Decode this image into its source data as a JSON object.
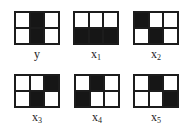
{
  "diagram": {
    "panels": [
      {
        "id": "y",
        "label_base": "y",
        "label_sub": "",
        "cells": [
          0,
          1,
          0,
          0,
          1,
          0
        ],
        "pos": [
          14,
          11
        ]
      },
      {
        "id": "x1",
        "label_base": "x",
        "label_sub": "1",
        "cells": [
          0,
          0,
          0,
          1,
          1,
          1
        ],
        "pos": [
          73,
          11
        ]
      },
      {
        "id": "x2",
        "label_base": "x",
        "label_sub": "2",
        "cells": [
          1,
          0,
          0,
          0,
          1,
          0
        ],
        "pos": [
          133,
          11
        ]
      },
      {
        "id": "x3",
        "label_base": "x",
        "label_sub": "3",
        "cells": [
          0,
          0,
          1,
          0,
          1,
          0
        ],
        "pos": [
          14,
          74
        ]
      },
      {
        "id": "x4",
        "label_base": "x",
        "label_sub": "4",
        "cells": [
          0,
          1,
          0,
          1,
          0,
          0
        ],
        "pos": [
          74,
          74
        ]
      },
      {
        "id": "x5",
        "label_base": "x",
        "label_sub": "5",
        "cells": [
          0,
          1,
          0,
          0,
          0,
          1
        ],
        "pos": [
          133,
          74
        ]
      }
    ],
    "grid": {
      "rows": 2,
      "cols": 3
    },
    "colors": {
      "filled": "#161616",
      "empty": "#ffffff",
      "border": "#1c1c1c"
    }
  }
}
